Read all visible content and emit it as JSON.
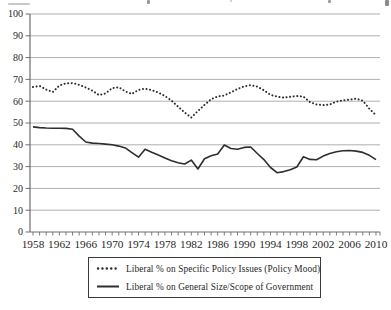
{
  "figure": {
    "kind": "book-figure-line-chart",
    "background": "#ffffff"
  },
  "chart_data": {
    "type": "line",
    "title": "",
    "xlabel": "",
    "ylabel": "",
    "xlim": [
      1958,
      2010
    ],
    "ylim": [
      0,
      100
    ],
    "grid": true,
    "legend_position": "bottom-center",
    "y_ticks": [
      0,
      10,
      20,
      30,
      40,
      50,
      60,
      70,
      80,
      90,
      100
    ],
    "x_tick_labels": [
      1958,
      1962,
      1966,
      1970,
      1974,
      1978,
      1982,
      1986,
      1990,
      1994,
      1998,
      2002,
      2006,
      2010
    ],
    "x": [
      1958,
      1959,
      1960,
      1961,
      1962,
      1963,
      1964,
      1965,
      1966,
      1967,
      1968,
      1969,
      1970,
      1971,
      1972,
      1973,
      1974,
      1975,
      1976,
      1977,
      1978,
      1979,
      1980,
      1981,
      1982,
      1983,
      1984,
      1985,
      1986,
      1987,
      1988,
      1989,
      1990,
      1991,
      1992,
      1993,
      1994,
      1995,
      1996,
      1997,
      1998,
      1999,
      2000,
      2001,
      2002,
      2003,
      2004,
      2005,
      2006,
      2007,
      2008,
      2009,
      2010
    ],
    "series": [
      {
        "name": "Liberal % on Specific Policy Issues (Policy Mood)",
        "style": "dotted",
        "values": [
          66.5,
          67,
          65.3,
          64.2,
          67.2,
          68.2,
          68.3,
          67.5,
          66.3,
          64.8,
          62.8,
          63.6,
          66,
          66.4,
          64.5,
          63.3,
          65.2,
          65.8,
          65.1,
          64,
          62.4,
          60.3,
          57.5,
          54.8,
          52.5,
          55.5,
          58.3,
          60.9,
          62.2,
          62.6,
          64.1,
          65.6,
          66.8,
          67.4,
          66.7,
          65,
          62.9,
          62.1,
          61.6,
          62,
          62.4,
          62.1,
          59.6,
          58.5,
          58.2,
          58.5,
          59.8,
          60.4,
          60.7,
          61.2,
          60.2,
          56.5,
          53.6
        ]
      },
      {
        "name": "Liberal % on General Size/Scope of Government",
        "style": "solid",
        "values": [
          48.2,
          47.9,
          47.7,
          47.6,
          47.6,
          47.5,
          47.1,
          44,
          41.3,
          40.8,
          40.6,
          40.3,
          40,
          39.4,
          38.6,
          36.4,
          34.3,
          38,
          36.6,
          35.3,
          34,
          32.7,
          31.8,
          31.2,
          33,
          28.9,
          33.6,
          35,
          35.8,
          39.9,
          38.3,
          38,
          38.8,
          39,
          36,
          33.2,
          29.6,
          27.2,
          27.7,
          28.6,
          29.8,
          34.5,
          33.3,
          33.1,
          34.8,
          36,
          36.8,
          37.3,
          37.4,
          37.1,
          36.5,
          35.2,
          33.2
        ]
      }
    ],
    "colors": {
      "line": "#2e2e2e",
      "grid": "#9b9b9b",
      "axis": "#6e6e6e",
      "text": "#1f1f1f"
    }
  }
}
